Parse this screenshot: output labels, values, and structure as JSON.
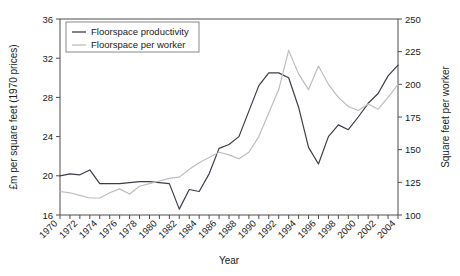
{
  "chart_data": {
    "type": "line",
    "title": "",
    "xlabel": "Year",
    "ylabel": "£m per square feet (1970 prices)",
    "y2label": "Square feet per worker",
    "xlim": [
      1970,
      2004
    ],
    "ylim": [
      16,
      36
    ],
    "y2lim": [
      100,
      250
    ],
    "grid": false,
    "legend_position": "top-left",
    "yticks": [
      16,
      20,
      24,
      28,
      32,
      36
    ],
    "y2ticks": [
      100,
      125,
      150,
      175,
      200,
      225,
      250
    ],
    "xticks": [
      1970,
      1972,
      1974,
      1976,
      1978,
      1980,
      1982,
      1984,
      1986,
      1988,
      1990,
      1992,
      1994,
      1996,
      1998,
      2000,
      2002,
      2004
    ],
    "x": [
      1970,
      1971,
      1972,
      1973,
      1974,
      1975,
      1976,
      1977,
      1978,
      1979,
      1980,
      1981,
      1982,
      1983,
      1984,
      1985,
      1986,
      1987,
      1988,
      1989,
      1990,
      1991,
      1992,
      1993,
      1994,
      1995,
      1996,
      1997,
      1998,
      1999,
      2000,
      2001,
      2002,
      2003,
      2004
    ],
    "series": [
      {
        "name": "Floorspace productivity",
        "color": "#3d3d4a",
        "axis": "left",
        "units": "£m per square feet (1970 prices)",
        "values": [
          20.0,
          20.2,
          20.1,
          20.6,
          19.2,
          19.2,
          19.2,
          19.3,
          19.4,
          19.4,
          19.3,
          19.2,
          16.6,
          18.6,
          18.4,
          20.2,
          22.8,
          23.2,
          24.0,
          26.6,
          29.2,
          30.5,
          30.5,
          30.0,
          27.0,
          22.9,
          21.2,
          24.0,
          25.2,
          24.7,
          26.0,
          27.4,
          28.4,
          30.2,
          31.3
        ]
      },
      {
        "name": "Floorspace per worker",
        "color": "#bdbdbd",
        "axis": "right",
        "units": "Square feet per worker",
        "values": [
          118,
          117,
          115,
          113,
          113,
          117,
          120,
          116,
          122,
          124,
          126,
          128,
          129,
          135,
          140,
          144,
          148,
          146,
          143,
          148,
          160,
          178,
          196,
          226,
          208,
          196,
          214,
          200,
          190,
          183,
          180,
          185,
          181,
          190,
          200
        ]
      }
    ],
    "legend": [
      {
        "label": "Floorspace productivity",
        "color": "#3d3d4a"
      },
      {
        "label": "Floorspace per worker",
        "color": "#bdbdbd"
      }
    ]
  }
}
